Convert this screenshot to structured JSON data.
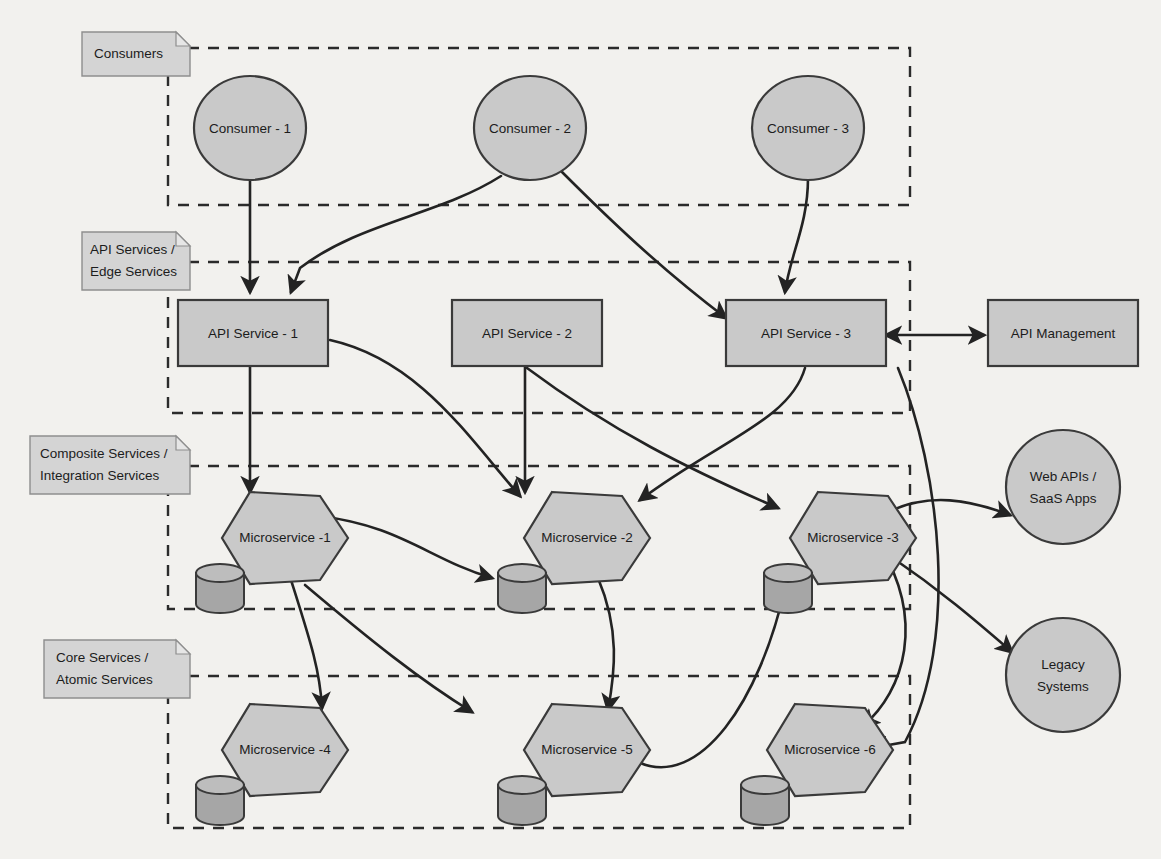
{
  "diagram": {
    "colors": {
      "background": "#f2f1ee",
      "shape_fill": "#c9c9c9",
      "shape_stroke": "#3a3a3a",
      "cylinder_fill": "#a6a6a6",
      "note_fill": "#d4d4d4",
      "edge_stroke": "#232323"
    },
    "layers": [
      {
        "id": "consumers",
        "label_line1": "Consumers",
        "label_line2": ""
      },
      {
        "id": "api-services",
        "label_line1": "API Services /",
        "label_line2": "Edge Services"
      },
      {
        "id": "composite-services",
        "label_line1": "Composite Services /",
        "label_line2": "Integration Services"
      },
      {
        "id": "core-services",
        "label_line1": "Core Services /",
        "label_line2": "Atomic Services"
      }
    ],
    "consumers": [
      {
        "id": "consumer-1",
        "label": "Consumer - 1"
      },
      {
        "id": "consumer-2",
        "label": "Consumer - 2"
      },
      {
        "id": "consumer-3",
        "label": "Consumer - 3"
      }
    ],
    "api_services": [
      {
        "id": "api-service-1",
        "label": "API Service - 1"
      },
      {
        "id": "api-service-2",
        "label": "API Service - 2"
      },
      {
        "id": "api-service-3",
        "label": "API Service - 3"
      }
    ],
    "composite_microservices": [
      {
        "id": "microservice-1",
        "label": "Microservice -1"
      },
      {
        "id": "microservice-2",
        "label": "Microservice -2"
      },
      {
        "id": "microservice-3",
        "label": "Microservice -3"
      }
    ],
    "core_microservices": [
      {
        "id": "microservice-4",
        "label": "Microservice -4"
      },
      {
        "id": "microservice-5",
        "label": "Microservice -5"
      },
      {
        "id": "microservice-6",
        "label": "Microservice -6"
      }
    ],
    "external": [
      {
        "id": "api-management",
        "label": "API Management",
        "shape": "rectangle"
      },
      {
        "id": "web-apis",
        "label_line1": "Web APIs /",
        "label_line2": "SaaS Apps",
        "shape": "circle"
      },
      {
        "id": "legacy-systems",
        "label_line1": "Legacy",
        "label_line2": "Systems",
        "shape": "circle"
      }
    ]
  }
}
